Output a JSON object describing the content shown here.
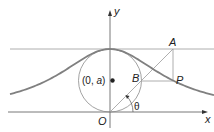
{
  "diagram": {
    "labels": {
      "y_axis": "y",
      "x_axis": "x",
      "origin": "O",
      "center_prefix": "(0, ",
      "center_a": "a",
      "center_suffix": ")",
      "point_a": "A",
      "point_b": "B",
      "point_p": "P",
      "angle": "θ"
    },
    "colors": {
      "axis": "#333333",
      "curve": "#808080",
      "thin_line": "#9a9a9a",
      "circle": "#8a8a8a",
      "text": "#222222"
    }
  }
}
